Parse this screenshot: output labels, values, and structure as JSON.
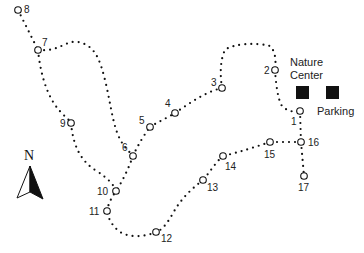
{
  "map": {
    "title": "Trail Map",
    "places": {
      "nature_center_line1": "Nature",
      "nature_center_line2": "Center",
      "parking": "Parking"
    },
    "compass": {
      "label": "N"
    },
    "stops": [
      {
        "id": "1",
        "label": "1",
        "x": 300,
        "y": 111
      },
      {
        "id": "2",
        "label": "2",
        "x": 275,
        "y": 70
      },
      {
        "id": "3",
        "label": "3",
        "x": 222,
        "y": 88
      },
      {
        "id": "4",
        "label": "4",
        "x": 175,
        "y": 113
      },
      {
        "id": "5",
        "label": "5",
        "x": 150,
        "y": 127
      },
      {
        "id": "6",
        "label": "6",
        "x": 133,
        "y": 156
      },
      {
        "id": "7",
        "label": "7",
        "x": 38,
        "y": 50
      },
      {
        "id": "8",
        "label": "8",
        "x": 18,
        "y": 10
      },
      {
        "id": "9",
        "label": "9",
        "x": 71,
        "y": 123
      },
      {
        "id": "10",
        "label": "10",
        "x": 116,
        "y": 191
      },
      {
        "id": "11",
        "label": "11",
        "x": 107,
        "y": 211
      },
      {
        "id": "12",
        "label": "12",
        "x": 156,
        "y": 232
      },
      {
        "id": "13",
        "label": "13",
        "x": 203,
        "y": 180
      },
      {
        "id": "14",
        "label": "14",
        "x": 223,
        "y": 156
      },
      {
        "id": "15",
        "label": "15",
        "x": 270,
        "y": 142
      },
      {
        "id": "16",
        "label": "16",
        "x": 301,
        "y": 142
      },
      {
        "id": "17",
        "label": "17",
        "x": 304,
        "y": 176
      }
    ]
  }
}
